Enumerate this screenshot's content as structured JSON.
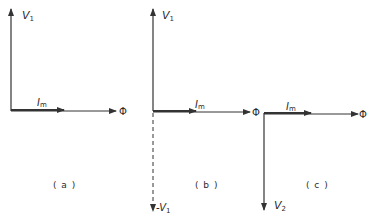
{
  "diagram": {
    "type": "phasor-diagrams",
    "colors": {
      "line": "#333333",
      "background": "#ffffff"
    },
    "panels": [
      {
        "id": "a",
        "caption": "( a )",
        "vectors": [
          {
            "name": "V1",
            "label": "V",
            "sub": "1",
            "direction": "up",
            "style": "solid"
          },
          {
            "name": "Im",
            "label": "I",
            "sub": "m",
            "direction": "right",
            "style": "solid",
            "relative_length": "short"
          },
          {
            "name": "Phi",
            "label": "Φ",
            "direction": "right",
            "style": "solid"
          }
        ]
      },
      {
        "id": "b",
        "caption": "( b )",
        "vectors": [
          {
            "name": "V1",
            "label": "V",
            "sub": "1",
            "direction": "up",
            "style": "solid"
          },
          {
            "name": "Im",
            "label": "I",
            "sub": "m",
            "direction": "right",
            "style": "solid",
            "relative_length": "short"
          },
          {
            "name": "Phi",
            "label": "Φ",
            "direction": "right",
            "style": "solid"
          },
          {
            "name": "-V1",
            "label": "-V",
            "sub": "1",
            "direction": "down",
            "style": "dashed"
          }
        ]
      },
      {
        "id": "c",
        "caption": "( c )",
        "vectors": [
          {
            "name": "Im",
            "label": "I",
            "sub": "m",
            "direction": "right",
            "style": "solid",
            "relative_length": "short"
          },
          {
            "name": "Phi",
            "label": "Φ",
            "direction": "right",
            "style": "solid"
          },
          {
            "name": "V2",
            "label": "V",
            "sub": "2",
            "direction": "down",
            "style": "solid"
          }
        ]
      }
    ]
  },
  "labels": {
    "a_v": "V",
    "a_v_sub": "1",
    "a_i": "I",
    "a_i_sub": "m",
    "a_phi": "Φ",
    "a_caption": "( a )",
    "b_v": "V",
    "b_v_sub": "1",
    "b_i": "I",
    "b_i_sub": "m",
    "b_phi": "Φ",
    "b_neg": "-V",
    "b_neg_sub": "1",
    "b_caption": "( b )",
    "c_i": "I",
    "c_i_sub": "m",
    "c_phi": "Φ",
    "c_v": "V",
    "c_v_sub": "2",
    "c_caption": "( c )"
  }
}
